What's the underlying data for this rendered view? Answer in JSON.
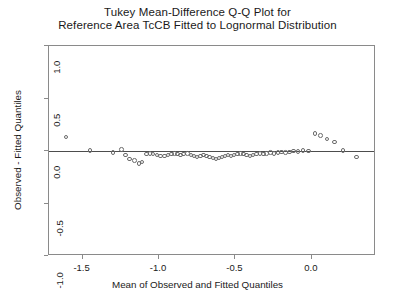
{
  "chart": {
    "title_line1": "Tukey Mean-Difference Q-Q Plot for",
    "title_line2": "Reference Area TcCB Fitted to Lognormal Distribution",
    "xlabel": "Mean of Observed and Fitted Quantiles",
    "ylabel": "Observed - Fitted Quantiles",
    "point_color": "#6b6b6b",
    "line_color": "#4d4d4d",
    "frame_color": "#8a8a8a"
  },
  "chart_data": {
    "type": "scatter",
    "title": "Tukey Mean-Difference Q-Q Plot for Reference Area TcCB Fitted to Lognormal Distribution",
    "xlabel": "Mean of Observed and Fitted Quantiles",
    "ylabel": "Observed - Fitted Quantiles",
    "xlim": [
      -1.72,
      0.42
    ],
    "ylim": [
      -1.0,
      1.0
    ],
    "xticks": [
      -1.5,
      -1.0,
      -0.5,
      0.0
    ],
    "xticklabels": [
      "-1.5",
      "-1.0",
      "-0.5",
      "0.0"
    ],
    "yticks": [
      -1.0,
      -0.5,
      0.0,
      0.5,
      1.0
    ],
    "yticklabels": [
      "-1.0",
      "-0.5",
      "0.0",
      "0.5",
      "1.0"
    ],
    "grid": false,
    "legend": null,
    "reference_line": {
      "type": "horizontal",
      "y": 0.0
    },
    "marker": "open-circle",
    "series": [
      {
        "name": "TcCB residuals",
        "x": [
          -1.61,
          -1.452,
          -1.3,
          -1.245,
          -1.218,
          -1.192,
          -1.16,
          -1.13,
          -1.112,
          -1.082,
          -1.06,
          -1.04,
          -1.012,
          -0.992,
          -0.965,
          -0.942,
          -0.918,
          -0.9,
          -0.878,
          -0.858,
          -0.838,
          -0.815,
          -0.792,
          -0.772,
          -0.752,
          -0.73,
          -0.708,
          -0.69,
          -0.668,
          -0.648,
          -0.628,
          -0.608,
          -0.588,
          -0.568,
          -0.548,
          -0.528,
          -0.508,
          -0.488,
          -0.468,
          -0.448,
          -0.428,
          -0.405,
          -0.385,
          -0.362,
          -0.338,
          -0.318,
          -0.295,
          -0.272,
          -0.248,
          -0.222,
          -0.198,
          -0.172,
          -0.148,
          -0.118,
          -0.09,
          -0.058,
          -0.022,
          0.022,
          0.058,
          0.098,
          0.148,
          0.205,
          0.292
        ],
        "y": [
          0.132,
          0.005,
          -0.015,
          0.015,
          -0.038,
          -0.075,
          -0.09,
          -0.118,
          -0.105,
          -0.03,
          -0.022,
          -0.03,
          -0.038,
          -0.048,
          -0.048,
          -0.04,
          -0.03,
          -0.022,
          -0.03,
          -0.038,
          -0.03,
          -0.022,
          -0.038,
          -0.048,
          -0.058,
          -0.048,
          -0.04,
          -0.048,
          -0.058,
          -0.068,
          -0.075,
          -0.068,
          -0.058,
          -0.048,
          -0.04,
          -0.048,
          -0.04,
          -0.03,
          -0.022,
          -0.03,
          -0.04,
          -0.048,
          -0.04,
          -0.03,
          -0.022,
          -0.03,
          -0.022,
          -0.015,
          -0.022,
          -0.015,
          -0.008,
          -0.015,
          -0.008,
          0.0,
          -0.005,
          0.005,
          0.0,
          0.165,
          0.148,
          0.115,
          0.085,
          0.002,
          -0.058
        ],
        "count": 63
      }
    ]
  }
}
